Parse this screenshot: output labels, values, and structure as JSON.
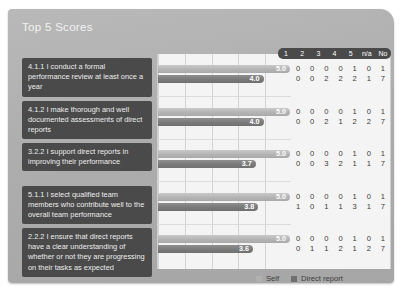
{
  "slide": {
    "title": "Top 5 Scores"
  },
  "chart_data": {
    "type": "bar",
    "title": "Top 5 Scores",
    "orientation": "horizontal",
    "xlabel": "",
    "ylabel": "",
    "xlim": [
      0,
      5
    ],
    "grid": true,
    "gridline_values": [
      0,
      1,
      2,
      3,
      4,
      5
    ],
    "legend_position": "bottom-right",
    "series": [
      {
        "name": "Self",
        "color": "#b0b0b0",
        "values": [
          5.0,
          5.0,
          5.0,
          5.0,
          5.0
        ],
        "labels": [
          "5.0",
          "5.0",
          "5.0",
          "5.0",
          "5.0"
        ]
      },
      {
        "name": "Direct report",
        "color": "#6f6f6f",
        "values": [
          4.0,
          4.0,
          3.7,
          3.8,
          3.6
        ],
        "labels": [
          "4.0",
          "4.0",
          "3.7",
          "3.8",
          "3.6"
        ]
      }
    ],
    "categories": [
      "4.1.1 I conduct a formal performance review at least once a year",
      "4.1.2 I make thorough and well documented assessments of direct reports",
      "3.2.2 I support direct reports in improving their performance",
      "5.1.1 I select qualified team members who contribute well to the overall team performance",
      "2.2.2 I ensure that direct reports have a clear understanding of whether or not they are progressing on their tasks as expected"
    ],
    "count_columns": [
      "1",
      "2",
      "3",
      "4",
      "5",
      "n/a",
      "No"
    ],
    "count_rows": [
      {
        "self": [
          "0",
          "0",
          "0",
          "0",
          "1",
          "0",
          "1"
        ],
        "direct": [
          "0",
          "0",
          "2",
          "2",
          "2",
          "1",
          "7"
        ]
      },
      {
        "self": [
          "0",
          "0",
          "0",
          "0",
          "1",
          "0",
          "1"
        ],
        "direct": [
          "0",
          "0",
          "2",
          "1",
          "2",
          "2",
          "7"
        ]
      },
      {
        "self": [
          "0",
          "0",
          "0",
          "0",
          "1",
          "0",
          "1"
        ],
        "direct": [
          "0",
          "0",
          "3",
          "2",
          "1",
          "1",
          "7"
        ]
      },
      {
        "self": [
          "0",
          "0",
          "0",
          "0",
          "1",
          "0",
          "1"
        ],
        "direct": [
          "1",
          "0",
          "1",
          "1",
          "3",
          "1",
          "7"
        ]
      },
      {
        "self": [
          "0",
          "0",
          "0",
          "0",
          "1",
          "0",
          "1"
        ],
        "direct": [
          "0",
          "1",
          "1",
          "2",
          "1",
          "2",
          "7"
        ]
      }
    ]
  },
  "rows": [
    {
      "label": "4.1.1 I conduct a formal performance review at least once a year",
      "self_value": "5.0",
      "direct_value": "4.0"
    },
    {
      "label": "4.1.2 I make thorough and well documented assessments of direct reports",
      "self_value": "5.0",
      "direct_value": "4.0"
    },
    {
      "label": "3.2.2 I support direct reports in improving their performance",
      "self_value": "5.0",
      "direct_value": "3.7"
    },
    {
      "label": "5.1.1 I select qualified team members who contribute well to the overall team performance",
      "self_value": "5.0",
      "direct_value": "3.8"
    },
    {
      "label": "2.2.2 I ensure that direct reports have a clear understanding of whether or not they are progressing on their tasks as expected",
      "self_value": "5.0",
      "direct_value": "3.6"
    }
  ],
  "legend": {
    "items": [
      {
        "label": "Self"
      },
      {
        "label": "Direct report"
      }
    ]
  }
}
